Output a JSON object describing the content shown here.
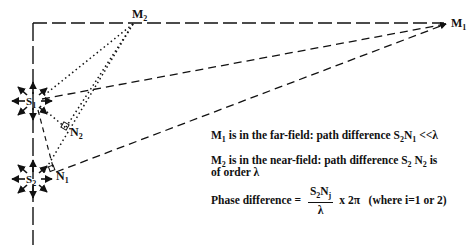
{
  "diagram": {
    "points": {
      "M1": {
        "label": "M",
        "sub": "1"
      },
      "M2": {
        "label": "M",
        "sub": "2"
      },
      "S1": {
        "label": "S",
        "sub": "1"
      },
      "S2": {
        "label": "S",
        "sub": "2"
      },
      "N1": {
        "label": "N",
        "sub": "1"
      },
      "N2": {
        "label": "N",
        "sub": "2"
      }
    },
    "notes": {
      "line1": {
        "m": "M",
        "msub": "1",
        "text": " is in the far-field: path difference S",
        "s": "2",
        "n": "N",
        "nsub": "1",
        "tail": " <<λ"
      },
      "line2": {
        "m": "M",
        "msub": "2",
        "text": " is in the near-field: path difference S",
        "s": "2",
        "n": " N",
        "nsub": "2",
        "tail": " is"
      },
      "line2b": "of order λ",
      "phase": {
        "prefix": "Phase difference = ",
        "num_s": "S",
        "num_s_sub": "2",
        "num_n": "N",
        "num_n_sub": "j",
        "den": "λ",
        "suffix": "x 2π",
        "where": "(where i=1 or 2)"
      }
    }
  }
}
